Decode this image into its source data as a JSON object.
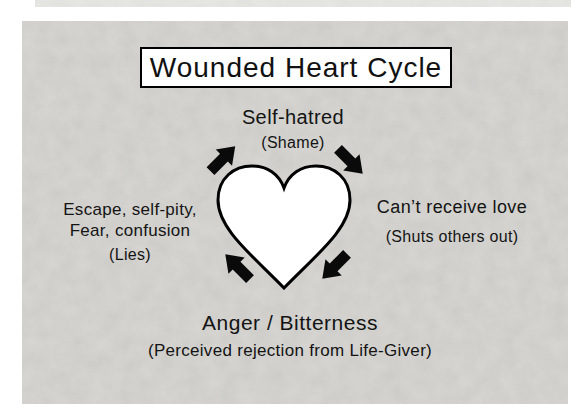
{
  "slide": {
    "title": "Wounded Heart Cycle",
    "nodes": {
      "top": {
        "label": "Self-hatred",
        "sub": "(Shame)"
      },
      "right": {
        "label": "Can’t receive love",
        "sub": "(Shuts others out)"
      },
      "left": {
        "lines": [
          "Escape, self-pity,",
          "Fear, confusion"
        ],
        "sub": "(Lies)"
      },
      "bottom": {
        "label": "Anger / Bitterness",
        "sub": "(Perceived rejection from Life-Giver)"
      }
    },
    "graphics": {
      "center_shape": "heart-outline",
      "arrows": [
        "up-right",
        "down-right",
        "down-left",
        "up-left"
      ],
      "cycle_direction": "clockwise"
    },
    "colors": {
      "slide_bg": "#d8d7d3",
      "strip_bg": "#e8e8e5",
      "title_box_bg": "#ffffff",
      "outline": "#000000",
      "text": "#141414",
      "arrow": "#0a0a0a",
      "heart_fill": "#ffffff"
    }
  }
}
